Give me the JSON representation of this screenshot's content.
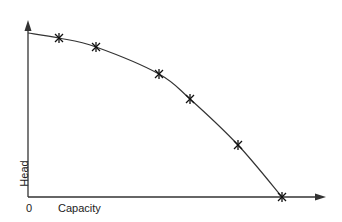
{
  "chart_data": {
    "type": "line",
    "title": "",
    "xlabel": "Capacity",
    "ylabel": "Head",
    "origin_label": "0",
    "grid": false,
    "legend": null,
    "axes": {
      "x_ticks": [],
      "y_ticks": [],
      "arrowheads": true
    },
    "curve_start": {
      "x": 0,
      "y": 100
    },
    "series": [
      {
        "name": "Pump head-capacity curve",
        "marker": "asterisk",
        "x": [
          10.4,
          22.8,
          44.3,
          54.4,
          70.5,
          85.2
        ],
        "y": [
          97.2,
          92.7,
          76.8,
          63.3,
          36.7,
          0
        ]
      }
    ],
    "xlim": [
      0,
      100
    ],
    "ylim": [
      0,
      100
    ]
  },
  "colors": {
    "line": "#333333",
    "axis": "#333333",
    "marker": "#111111",
    "background": "#ffffff"
  },
  "pixel_geometry": {
    "origin": [
      28,
      197
    ],
    "y_axis_top": [
      28,
      20
    ],
    "x_axis_right": [
      326,
      197
    ],
    "curve_start": [
      28,
      33
    ],
    "markers": [
      [
        59,
        38
      ],
      [
        96,
        47
      ],
      [
        159,
        74
      ],
      [
        190,
        99
      ],
      [
        238,
        145
      ],
      [
        282,
        197
      ]
    ]
  }
}
